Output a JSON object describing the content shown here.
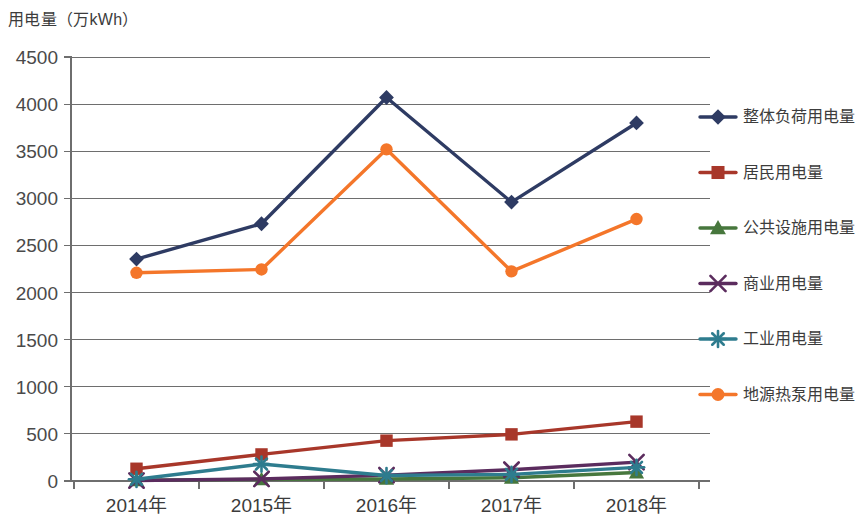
{
  "chart_data": {
    "type": "line",
    "title": "用电量（万kWh）",
    "xlabel": "",
    "ylabel": "用电量（万kWh）",
    "categories": [
      "2014年",
      "2015年",
      "2016年",
      "2017年",
      "2018年"
    ],
    "ylim": [
      0,
      4500
    ],
    "yticks": [
      "0",
      "500",
      "1000",
      "1500",
      "2000",
      "2500",
      "3000",
      "3500",
      "4000",
      "4500"
    ],
    "grid": true,
    "legend_position": "right",
    "series": [
      {
        "name": "整体负荷用电量",
        "color": "#2E3B63",
        "marker": "diamond",
        "values": [
          2355,
          2730,
          4070,
          2960,
          3800
        ]
      },
      {
        "name": "居民用电量",
        "color": "#A8372A",
        "marker": "square",
        "values": [
          130,
          282,
          428,
          495,
          630
        ]
      },
      {
        "name": "公共设施用电量",
        "color": "#47773D",
        "marker": "triangle",
        "values": [
          8,
          18,
          22,
          35,
          90
        ]
      },
      {
        "name": "商业用电量",
        "color": "#5B2C5E",
        "marker": "cross",
        "values": [
          5,
          22,
          62,
          120,
          200
        ]
      },
      {
        "name": "工业用电量",
        "color": "#2E7C8E",
        "marker": "asterisk",
        "values": [
          18,
          180,
          58,
          70,
          145
        ]
      },
      {
        "name": "地源热泵用电量",
        "color": "#F4762A",
        "marker": "circle",
        "values": [
          2210,
          2245,
          3520,
          2225,
          2780
        ]
      }
    ]
  }
}
